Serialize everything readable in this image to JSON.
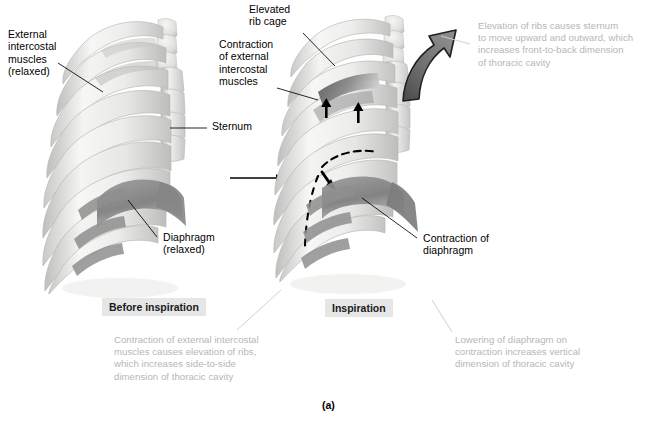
{
  "figure": {
    "panel_letter": "(a)",
    "title_internal": "Mechanics of inspiration"
  },
  "captions": {
    "before": "Before inspiration",
    "during": "Inspiration"
  },
  "labels": {
    "external_intercostal_relaxed": "External\nintercostal\nmuscles\n(relaxed)",
    "sternum": "Sternum",
    "diaphragm_relaxed": "Diaphragm\n(relaxed)",
    "elevated_rib_cage": "Elevated\nrib cage",
    "contraction_external_intercostal": "Contraction\nof external\nintercostal\nmuscles",
    "contraction_diaphragm": "Contraction of\ndiaphragm"
  },
  "annotations": {
    "sternum_movement": "Elevation of ribs causes sternum\nto move upward and outward, which\nincreases front-to-back dimension\nof thoracic cavity",
    "side_to_side": "Contraction of external intercostal\nmuscles causes elevation of ribs,\nwhich increases side-to-side\ndimension of thoracic cavity",
    "vertical": "Lowering of diaphragm on\ncontraction increases vertical\ndimension of thoracic cavity"
  },
  "colors": {
    "bone_light": "#f2f2f0",
    "bone_mid": "#dcdcda",
    "bone_shadow": "#bdbdbb",
    "muscle_dark": "#8d8d8d",
    "muscle_darker": "#6f6f6f",
    "arrow_gray": "#6e6e6e",
    "arrow_black": "#000000",
    "text_black": "#000000",
    "text_gray": "#b6b6b6",
    "caption_bg": "#e6e6e6",
    "leader_gray": "#d4d4d4"
  },
  "icons": {
    "transition_arrow": "right-arrow-icon",
    "sternum_arrow": "curved-up-arrow-icon",
    "intercostal_arrow_left": "up-arrow-icon",
    "intercostal_arrow_right": "up-arrow-icon",
    "diaphragm_arrow": "down-right-arrow-icon",
    "dashed_diaphragm": "dashed-outline-icon"
  }
}
